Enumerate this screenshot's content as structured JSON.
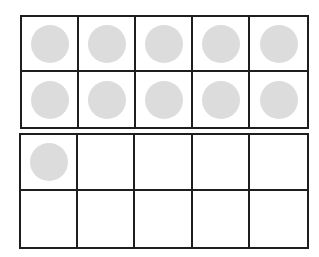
{
  "diagram": {
    "type": "ten-frames",
    "counter_color": "#dcdcdc",
    "line_color": "#1e1e1e",
    "frames": [
      {
        "name": "top-ten-frame",
        "rows": 2,
        "cols": 5,
        "filled": [
          1,
          1,
          1,
          1,
          1,
          1,
          1,
          1,
          1,
          1
        ],
        "count": 10
      },
      {
        "name": "bottom-ten-frame",
        "rows": 2,
        "cols": 5,
        "filled": [
          1,
          0,
          0,
          0,
          0,
          0,
          0,
          0,
          0,
          0
        ],
        "count": 1
      }
    ],
    "total": 11
  }
}
